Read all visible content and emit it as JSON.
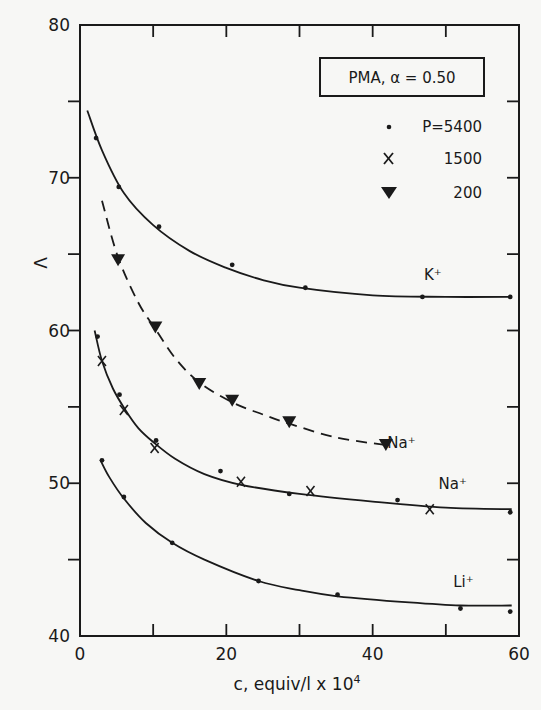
{
  "chart_data": {
    "type": "scatter",
    "title": "PMA, α = 0.50",
    "xlabel": "c, equiv/l x 10⁴",
    "ylabel": "Λ",
    "xlim": [
      0,
      60
    ],
    "ylim": [
      40,
      80
    ],
    "xticks": [
      0,
      20,
      40,
      60
    ],
    "xminor_ticks": [
      10,
      30,
      50
    ],
    "yticks": [
      40,
      50,
      60,
      70,
      80
    ],
    "yminor_ticks": [
      45,
      55,
      65,
      75
    ],
    "grid": false,
    "legend_position": "upper right",
    "legend": [
      {
        "marker": "dot",
        "label": "P=5400"
      },
      {
        "marker": "x",
        "label": "1500"
      },
      {
        "marker": "triangle-down-filled",
        "label": "200"
      }
    ],
    "series": [
      {
        "name": "K+ (P=5400)",
        "label": "K⁺",
        "line": "solid",
        "marker": "dot",
        "points": [
          [
            2.2,
            72.6
          ],
          [
            5.3,
            69.4
          ],
          [
            10.8,
            66.8
          ],
          [
            20.8,
            64.3
          ],
          [
            30.8,
            62.8
          ],
          [
            46.8,
            62.2
          ],
          [
            58.8,
            62.2
          ]
        ],
        "fit": [
          [
            1.0,
            74.4
          ],
          [
            3,
            71.8
          ],
          [
            6,
            69.0
          ],
          [
            10,
            66.9
          ],
          [
            15,
            65.2
          ],
          [
            20,
            64.1
          ],
          [
            25,
            63.3
          ],
          [
            30,
            62.8
          ],
          [
            40,
            62.3
          ],
          [
            50,
            62.2
          ],
          [
            59,
            62.2
          ]
        ]
      },
      {
        "name": "Na+ (P=200)",
        "label": "Na⁺",
        "line": "dashed",
        "marker": "triangle-down-filled",
        "points": [
          [
            5.2,
            64.6
          ],
          [
            10.3,
            60.2
          ],
          [
            16.3,
            56.5
          ],
          [
            20.8,
            55.4
          ],
          [
            28.6,
            54.0
          ],
          [
            41.8,
            52.5
          ]
        ],
        "fit": [
          [
            3.0,
            68.5
          ],
          [
            5.2,
            64.8
          ],
          [
            8,
            61.8
          ],
          [
            10.3,
            60.1
          ],
          [
            13,
            58.2
          ],
          [
            16.3,
            56.6
          ],
          [
            20.8,
            55.3
          ],
          [
            25,
            54.5
          ],
          [
            28.6,
            53.9
          ],
          [
            35,
            53.0
          ],
          [
            41.8,
            52.5
          ]
        ]
      },
      {
        "name": "Na+ (P=5400)",
        "label": "Na⁺",
        "line": "solid",
        "marker": "dot",
        "points": [
          [
            2.4,
            59.6
          ],
          [
            5.4,
            55.8
          ],
          [
            10.4,
            52.8
          ],
          [
            19.2,
            50.8
          ],
          [
            28.6,
            49.3
          ],
          [
            43.4,
            48.9
          ],
          [
            58.8,
            48.1
          ]
        ],
        "fit": [
          [
            2.0,
            60.0
          ],
          [
            3,
            58.0
          ],
          [
            4.5,
            56.2
          ],
          [
            6.2,
            54.8
          ],
          [
            8,
            53.6
          ],
          [
            10,
            52.7
          ],
          [
            13,
            51.6
          ],
          [
            17,
            50.6
          ],
          [
            22,
            49.9
          ],
          [
            30,
            49.3
          ],
          [
            40,
            48.8
          ],
          [
            50,
            48.4
          ],
          [
            59,
            48.3
          ]
        ]
      },
      {
        "name": "Na+ (P=1500)",
        "label": "Na⁺",
        "line": "solid",
        "marker": "x",
        "points": [
          [
            3.0,
            58.0
          ],
          [
            6.0,
            54.8
          ],
          [
            10.2,
            52.3
          ],
          [
            22.0,
            50.1
          ],
          [
            31.5,
            49.5
          ],
          [
            47.8,
            48.3
          ]
        ]
      },
      {
        "name": "Li+ (P=5400)",
        "label": "Li⁺",
        "line": "solid",
        "marker": "dot",
        "points": [
          [
            3.0,
            51.5
          ],
          [
            6.0,
            49.1
          ],
          [
            12.6,
            46.1
          ],
          [
            24.4,
            43.6
          ],
          [
            35.2,
            42.7
          ],
          [
            52.0,
            41.8
          ],
          [
            58.8,
            41.6
          ]
        ],
        "fit": [
          [
            2.8,
            51.5
          ],
          [
            4,
            50.4
          ],
          [
            6,
            49.0
          ],
          [
            9,
            47.4
          ],
          [
            12.6,
            46.1
          ],
          [
            17,
            45.0
          ],
          [
            24.4,
            43.6
          ],
          [
            30,
            43.0
          ],
          [
            35.2,
            42.6
          ],
          [
            45,
            42.2
          ],
          [
            52,
            42.0
          ],
          [
            59,
            42.0
          ]
        ]
      }
    ],
    "annotations": [
      {
        "text": "K⁺",
        "x": 47,
        "y": 63.3
      },
      {
        "text": "Na⁺",
        "x": 42,
        "y": 52.3
      },
      {
        "text": "Na⁺",
        "x": 49,
        "y": 49.6
      },
      {
        "text": "Li⁺",
        "x": 51,
        "y": 43.2
      }
    ]
  },
  "legend_box": {
    "title": "PMA, α = 0.50",
    "entries": [
      {
        "marker": "dot",
        "label": "P=5400"
      },
      {
        "marker": "x",
        "label": "1500"
      },
      {
        "marker": "triangle-down-filled",
        "label": "200"
      }
    ]
  },
  "axes": {
    "x_title": "c, equiv/l x 10",
    "x_title_exponent": "4",
    "y_title": "Λ",
    "x_tick_labels": [
      "0",
      "20",
      "40",
      "60"
    ],
    "y_tick_labels": [
      "40",
      "50",
      "60",
      "70",
      "80"
    ]
  },
  "colors": {
    "ink": "#1a1a1a",
    "paper": "#f7f7f5"
  }
}
